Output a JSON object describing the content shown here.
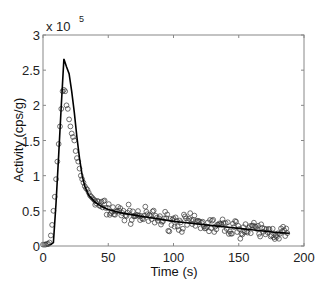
{
  "chart_data": {
    "type": "scatter",
    "title": "",
    "xlabel": "Time (s)",
    "ylabel": "Activity (cps/g)",
    "y_multiplier_label": "x 10",
    "y_multiplier_exp": "5",
    "xlim": [
      0,
      200
    ],
    "ylim": [
      0,
      3
    ],
    "y_scale": 100000,
    "xticks": [
      0,
      50,
      100,
      150,
      200
    ],
    "yticks": [
      0,
      0.5,
      1,
      1.5,
      2,
      2.5,
      3
    ],
    "xtick_labels": [
      "0",
      "50",
      "100",
      "150",
      "200"
    ],
    "ytick_labels": [
      "0",
      "0.5",
      "1",
      "1.5",
      "2",
      "2.5",
      "3"
    ],
    "grid": false,
    "legend": null,
    "series": [
      {
        "name": "model fit",
        "style": "line",
        "color": "#000000",
        "x": [
          0,
          4,
          6,
          8,
          10,
          12,
          14,
          16,
          18,
          20,
          22,
          24,
          26,
          28,
          30,
          32,
          35,
          40,
          45,
          50,
          60,
          70,
          80,
          90,
          100,
          110,
          120,
          130,
          140,
          150,
          160,
          170,
          180,
          189
        ],
        "y": [
          0,
          0,
          0.02,
          0.05,
          0.6,
          1.3,
          2.0,
          2.66,
          2.55,
          2.45,
          2.2,
          1.9,
          1.55,
          1.25,
          1.0,
          0.85,
          0.72,
          0.62,
          0.56,
          0.52,
          0.47,
          0.44,
          0.41,
          0.38,
          0.35,
          0.33,
          0.31,
          0.29,
          0.27,
          0.25,
          0.23,
          0.21,
          0.19,
          0.18
        ]
      },
      {
        "name": "measured data",
        "style": "open-circle",
        "color": "#333333",
        "x": [
          0,
          1,
          2,
          3,
          4,
          5,
          6,
          7,
          8,
          9,
          10,
          11,
          12,
          13,
          14,
          15,
          16,
          17,
          18,
          19,
          20,
          21,
          22,
          23,
          24,
          25,
          26,
          27,
          28,
          29,
          30,
          31,
          32,
          33,
          34,
          35,
          36,
          37,
          38,
          39,
          40
        ],
        "y": [
          0.02,
          0.02,
          0.02,
          0.03,
          0.03,
          0.05,
          0.15,
          0.3,
          0.5,
          0.7,
          0.95,
          1.2,
          1.45,
          1.7,
          1.95,
          2.2,
          2.22,
          2.2,
          2.0,
          1.95,
          1.8,
          1.7,
          1.6,
          1.55,
          1.5,
          1.35,
          1.25,
          1.2,
          1.1,
          1.0,
          0.95,
          0.9,
          0.85,
          0.82,
          0.8,
          0.76,
          0.72,
          0.7,
          0.68,
          0.66,
          0.64
        ]
      }
    ],
    "noise_band": {
      "x_start": 40,
      "x_end": 188,
      "spacing": 0.8,
      "spread": 0.09,
      "follows_series": "model fit"
    }
  }
}
